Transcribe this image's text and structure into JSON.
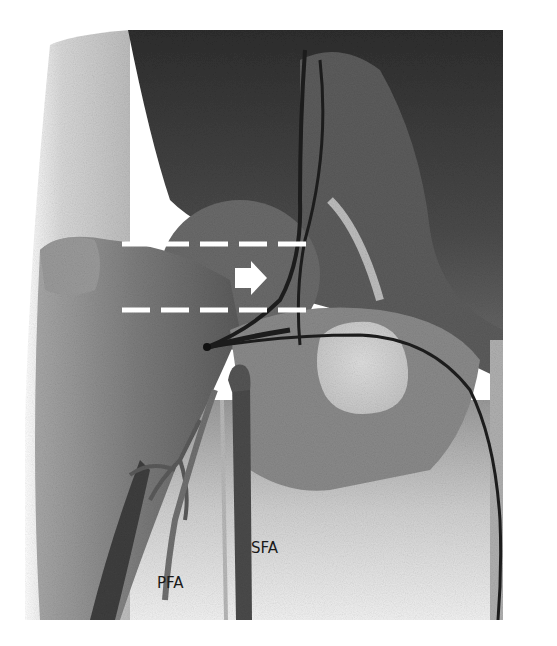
{
  "figure": {
    "labels": [
      {
        "id": "pfa",
        "text": "PFA"
      },
      {
        "id": "sfa",
        "text": "SFA"
      }
    ],
    "annotations": {
      "dashed_lines": [
        {
          "name": "upper-dashed-line",
          "y": 243,
          "x_start": 122,
          "x_end": 308,
          "color": "#ffffff"
        },
        {
          "name": "lower-dashed-line",
          "y": 309,
          "x_start": 122,
          "x_end": 308,
          "color": "#ffffff"
        }
      ],
      "arrow": {
        "name": "right-arrow",
        "direction": "right",
        "x": 235,
        "y": 276,
        "color": "#ffffff"
      }
    },
    "colors": {
      "background": "#ffffff",
      "dark_tissue": "#3a3a3a",
      "mid_tissue": "#7a7a7a",
      "light_tissue": "#c8c8c8",
      "catheter": "#1e1e1e",
      "annotation": "#ffffff"
    }
  }
}
